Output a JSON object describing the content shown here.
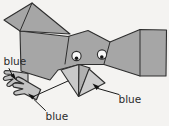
{
  "diagram": {
    "canvas": {
      "width": 169,
      "height": 126,
      "background": "#f4f3f1"
    },
    "colors": {
      "body": "#a6a6a6",
      "outline": "#2e2e2e",
      "beak_front": "#c9c9c9",
      "beak_side": "#b0b0b0",
      "beak_flap": "#cccccc",
      "feet": "#c2c2c2",
      "eye_white": "#f8f8f8",
      "pupil": "#151515",
      "label_text": "#2b2b2b",
      "arrow": "#111111"
    },
    "parts": [
      "wing",
      "body",
      "head",
      "tail",
      "tail-end-tab",
      "left-eye",
      "right-eye",
      "beak",
      "beak-flap",
      "left-foot",
      "bottom-foot"
    ],
    "annotations": [
      {
        "text": "blue",
        "points_to": "left-foot"
      },
      {
        "text": "blue",
        "points_to": "bottom-foot"
      },
      {
        "text": "blue",
        "points_to": "beak"
      }
    ]
  }
}
